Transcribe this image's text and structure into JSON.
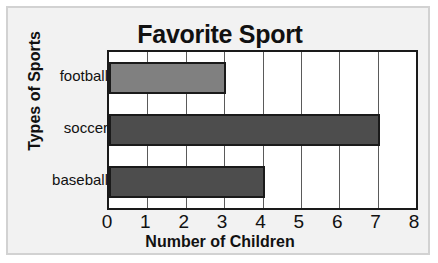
{
  "chart_data": {
    "type": "bar",
    "orientation": "horizontal",
    "title": "Favorite Sport",
    "xlabel": "Number of Children",
    "ylabel": "Types of Sports",
    "categories": [
      "football",
      "soccer",
      "baseball"
    ],
    "values": [
      3,
      7,
      4
    ],
    "bar_colors": [
      "#808080",
      "#4d4d4d",
      "#4d4d4d"
    ],
    "xlim": [
      0,
      8
    ],
    "xticks": [
      0,
      1,
      2,
      3,
      4,
      5,
      6,
      7,
      8
    ],
    "xtick_labels": [
      "0",
      "1",
      "2",
      "3",
      "4",
      "5",
      "6",
      "7",
      "8"
    ],
    "grid": true,
    "grid_axis": "x",
    "legend": false,
    "plot_background": "#ffffff",
    "figure_background": "#f2f2f2",
    "axis_color": "#1a1a1a"
  }
}
